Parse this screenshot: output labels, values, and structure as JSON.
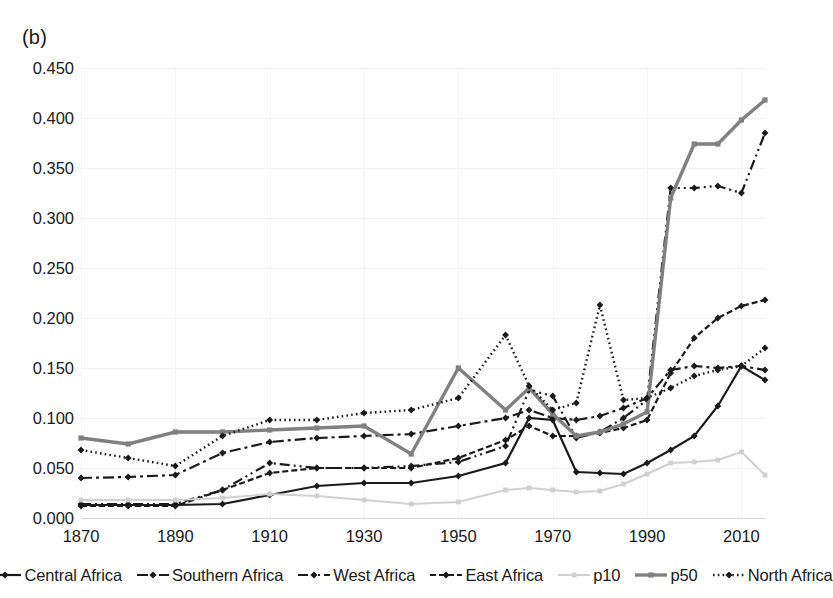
{
  "panel": {
    "label": "(b)"
  },
  "axes": {
    "y_ticks": [
      "0.000",
      "0.050",
      "0.100",
      "0.150",
      "0.200",
      "0.250",
      "0.300",
      "0.350",
      "0.400",
      "0.450"
    ],
    "x_ticks": [
      "1870",
      "1890",
      "1910",
      "1930",
      "1950",
      "1970",
      "1990",
      "2010"
    ]
  },
  "legend": {
    "items": [
      {
        "label": "Central Africa",
        "style": "solid-marker",
        "color": "#1a1a1a"
      },
      {
        "label": "Southern Africa",
        "style": "dash-dot",
        "color": "#1a1a1a"
      },
      {
        "label": "West Africa",
        "style": "dash-dot-dot",
        "color": "#1a1a1a"
      },
      {
        "label": "East Africa",
        "style": "dashed",
        "color": "#1a1a1a"
      },
      {
        "label": "p10",
        "style": "solid-light",
        "color": "#d0d0d0"
      },
      {
        "label": "p50",
        "style": "solid-thick",
        "color": "#808080"
      },
      {
        "label": "North Africa",
        "style": "dotted",
        "color": "#1a1a1a"
      }
    ]
  },
  "chart_data": {
    "type": "line",
    "title": "(b)",
    "xlabel": "",
    "ylabel": "",
    "xlim": [
      1870,
      2015
    ],
    "ylim": [
      0.0,
      0.45
    ],
    "grid": true,
    "legend_position": "bottom",
    "x": [
      1870,
      1880,
      1890,
      1900,
      1910,
      1920,
      1930,
      1940,
      1950,
      1960,
      1965,
      1970,
      1975,
      1980,
      1985,
      1990,
      1995,
      2000,
      2005,
      2010,
      2015
    ],
    "series": [
      {
        "name": "Central Africa",
        "color": "#1a1a1a",
        "style": "solid-marker",
        "values": [
          0.013,
          0.013,
          0.013,
          0.014,
          0.023,
          0.032,
          0.035,
          0.035,
          0.042,
          0.055,
          0.1,
          0.098,
          0.046,
          0.045,
          0.044,
          0.055,
          0.068,
          0.082,
          0.112,
          0.152,
          0.138
        ]
      },
      {
        "name": "Southern Africa",
        "color": "#1a1a1a",
        "style": "dash-dot",
        "values": [
          0.04,
          0.041,
          0.043,
          0.065,
          0.076,
          0.08,
          0.082,
          0.084,
          0.092,
          0.1,
          0.108,
          0.1,
          0.098,
          0.102,
          0.11,
          0.12,
          0.148,
          0.152,
          0.15,
          0.152,
          0.148
        ]
      },
      {
        "name": "West Africa",
        "color": "#1a1a1a",
        "style": "dash-dot-dot",
        "values": [
          0.014,
          0.014,
          0.014,
          0.028,
          0.055,
          0.05,
          0.05,
          0.052,
          0.056,
          0.072,
          0.128,
          0.122,
          0.08,
          0.086,
          0.1,
          0.118,
          0.33,
          0.33,
          0.332,
          0.325,
          0.385
        ]
      },
      {
        "name": "East Africa",
        "color": "#1a1a1a",
        "style": "dashed",
        "values": [
          0.012,
          0.012,
          0.012,
          0.028,
          0.045,
          0.05,
          0.05,
          0.05,
          0.06,
          0.078,
          0.092,
          0.082,
          0.082,
          0.085,
          0.09,
          0.098,
          0.145,
          0.18,
          0.2,
          0.212,
          0.218
        ]
      },
      {
        "name": "p10",
        "color": "#d0d0d0",
        "style": "solid-light",
        "values": [
          0.018,
          0.018,
          0.018,
          0.02,
          0.024,
          0.022,
          0.018,
          0.014,
          0.016,
          0.028,
          0.03,
          0.028,
          0.026,
          0.027,
          0.034,
          0.044,
          0.055,
          0.056,
          0.058,
          0.066,
          0.043
        ]
      },
      {
        "name": "p50",
        "color": "#808080",
        "style": "solid-thick",
        "values": [
          0.08,
          0.074,
          0.086,
          0.086,
          0.088,
          0.09,
          0.092,
          0.064,
          0.15,
          0.108,
          0.13,
          0.104,
          0.082,
          0.086,
          0.094,
          0.106,
          0.32,
          0.374,
          0.374,
          0.398,
          0.418
        ]
      },
      {
        "name": "North Africa",
        "color": "#1a1a1a",
        "style": "dotted",
        "values": [
          0.068,
          0.06,
          0.052,
          0.082,
          0.098,
          0.098,
          0.105,
          0.108,
          0.12,
          0.183,
          0.132,
          0.108,
          0.115,
          0.213,
          0.118,
          0.12,
          0.13,
          0.142,
          0.148,
          0.152,
          0.17
        ]
      }
    ]
  }
}
